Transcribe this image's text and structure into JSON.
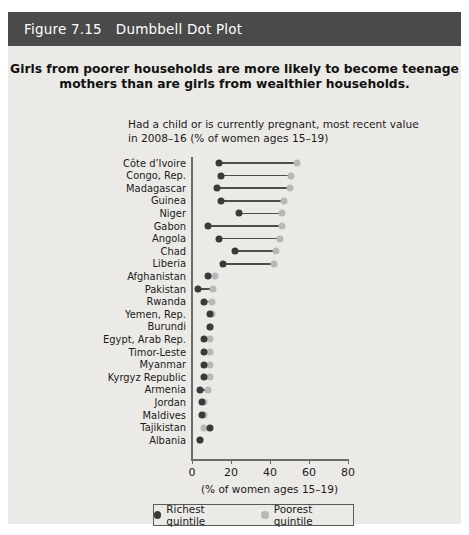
{
  "figure": {
    "number": "Figure 7.15",
    "header_title": "Dumbbell Dot Plot",
    "header_bg": "#4a4a4a",
    "card_bg": "#eceae6"
  },
  "chart_data": {
    "type": "scatter",
    "subtype": "dumbbell-dot-plot",
    "title": "Girls from poorer households are more likely to become teenage mothers than are girls from wealthier households.",
    "subtitle": "Had a child or is currently pregnant, most recent value in 2008–16 (% of women ages 15–19)",
    "xlabel": "(% of women ages 15–19)",
    "ylabel": "",
    "xlim": [
      0,
      80
    ],
    "xticks": [
      0,
      20,
      40,
      60,
      80
    ],
    "xtick_labels": [
      "0",
      "20",
      "40",
      "60",
      "80"
    ],
    "grid": false,
    "legend_position": "bottom",
    "series": [
      {
        "name": "Richest quintile",
        "color": "#3a3a3a"
      },
      {
        "name": "Poorest quintile",
        "color": "#b8b8b8"
      }
    ],
    "categories": [
      "Côte d’Ivoire",
      "Congo, Rep.",
      "Madagascar",
      "Guinea",
      "Niger",
      "Gabon",
      "Angola",
      "Chad",
      "Liberia",
      "Afghanistan",
      "Pakistan",
      "Rwanda",
      "Yemen, Rep.",
      "Burundi",
      "Egypt, Arab Rep.",
      "Timor-Leste",
      "Myanmar",
      "Kyrgyz Republic",
      "Armenia",
      "Jordan",
      "Maldives",
      "Tajikistan",
      "Albania"
    ],
    "richest": [
      14,
      15,
      13,
      15,
      24,
      8,
      14,
      22,
      16,
      8,
      3,
      6,
      9,
      9,
      6,
      6,
      6,
      6,
      4,
      5,
      5,
      9,
      4
    ],
    "poorest": [
      54,
      51,
      50,
      47,
      46,
      46,
      45,
      43,
      42,
      12,
      11,
      10,
      10,
      9,
      9,
      9,
      9,
      9,
      8,
      6,
      6,
      6,
      4
    ]
  },
  "legend": {
    "items": [
      {
        "label": "Richest quintile",
        "swatch": "dark-dot-icon"
      },
      {
        "label": "Poorest quintile",
        "swatch": "light-dot-icon"
      }
    ]
  }
}
